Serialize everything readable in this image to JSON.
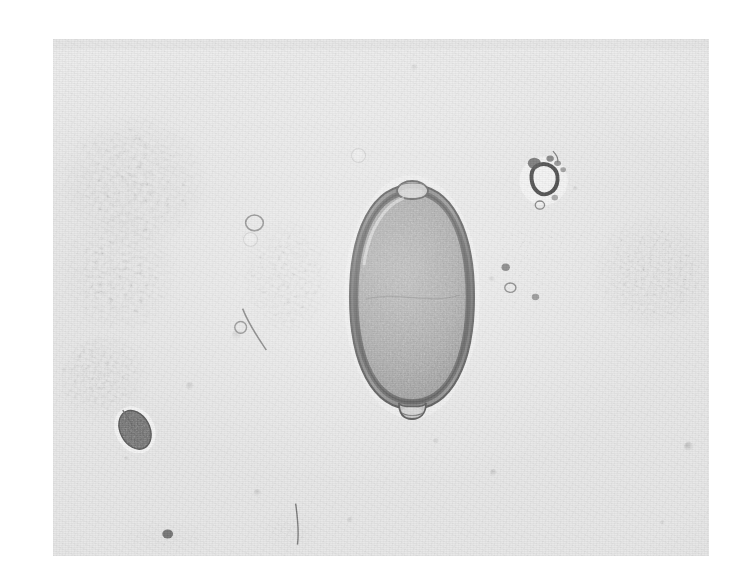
{
  "image": {
    "kind": "light-micrograph",
    "medium": "black-and-white photographic print",
    "subject": "Trichuris trichiura (whipworm) egg in faecal smear",
    "background_color": "#ffffff",
    "plate_color": "#e7e7e7",
    "plate": {
      "left": 53,
      "top": 39,
      "width": 656,
      "height": 517
    },
    "canvas": {
      "width": 741,
      "height": 587
    }
  },
  "specimen": {
    "name": "whipworm-egg",
    "common_name": "Trichuris trichiura egg",
    "shape": "barrel / lemon shaped",
    "features": [
      "bipolar mucoid plugs",
      "thick smooth shell",
      "granular unembryonated contents"
    ],
    "position": {
      "left": 342,
      "top": 173,
      "width": 140,
      "height": 248
    },
    "shell_color": "#6d6d6d",
    "interior_color": "#9b9b9b",
    "plug_color": "#c9c9c9"
  },
  "field_objects": [
    {
      "name": "debris-cluster-upper-left",
      "left": 60,
      "top": 112,
      "width": 150,
      "height": 140,
      "density": 0.95,
      "seed": 11
    },
    {
      "name": "debris-cluster-mid-left",
      "left": 64,
      "top": 206,
      "width": 120,
      "height": 132,
      "density": 0.85,
      "seed": 23
    },
    {
      "name": "debris-cluster-center",
      "left": 232,
      "top": 214,
      "width": 110,
      "height": 138,
      "density": 0.9,
      "seed": 37
    },
    {
      "name": "debris-cluster-lower-left",
      "left": 62,
      "top": 336,
      "width": 110,
      "height": 110,
      "density": 0.7,
      "seed": 53
    },
    {
      "name": "debris-cluster-right-upper",
      "left": 512,
      "top": 148,
      "width": 80,
      "height": 90,
      "density": 0.6,
      "seed": 71
    },
    {
      "name": "debris-cluster-right-mid",
      "left": 500,
      "top": 230,
      "width": 110,
      "height": 80,
      "density": 0.55,
      "seed": 89
    },
    {
      "name": "debris-cluster-right-large",
      "left": 586,
      "top": 200,
      "width": 128,
      "height": 130,
      "density": 1.0,
      "seed": 101
    },
    {
      "name": "debris-cluster-bottom-left",
      "left": 110,
      "top": 516,
      "width": 110,
      "height": 36,
      "density": 0.45,
      "seed": 113
    },
    {
      "name": "debris-cluster-bottom-mid",
      "left": 256,
      "top": 500,
      "width": 70,
      "height": 52,
      "density": 0.45,
      "seed": 127
    },
    {
      "name": "dark-ovoid-body",
      "left": 108,
      "top": 400,
      "width": 54,
      "height": 58,
      "density": 1.0,
      "seed": 139
    }
  ],
  "specks": [
    {
      "name": "speck-a",
      "left": 351,
      "top": 148,
      "size": 13,
      "opacity": 0.55
    },
    {
      "name": "speck-b",
      "left": 243,
      "top": 232,
      "size": 13,
      "opacity": 0.5
    },
    {
      "name": "speck-c",
      "left": 186,
      "top": 382,
      "size": 8,
      "opacity": 0.4
    },
    {
      "name": "speck-d",
      "left": 489,
      "top": 276,
      "size": 6,
      "opacity": 0.4
    },
    {
      "name": "speck-e",
      "left": 433,
      "top": 438,
      "size": 6,
      "opacity": 0.35
    },
    {
      "name": "speck-f",
      "left": 347,
      "top": 517,
      "size": 6,
      "opacity": 0.35
    },
    {
      "name": "speck-g",
      "left": 254,
      "top": 489,
      "size": 7,
      "opacity": 0.4
    },
    {
      "name": "speck-h",
      "left": 490,
      "top": 469,
      "size": 7,
      "opacity": 0.45
    },
    {
      "name": "speck-i",
      "left": 684,
      "top": 442,
      "size": 9,
      "opacity": 0.6
    },
    {
      "name": "speck-j",
      "left": 573,
      "top": 186,
      "size": 5,
      "opacity": 0.35
    },
    {
      "name": "speck-k",
      "left": 411,
      "top": 64,
      "size": 7,
      "opacity": 0.35
    },
    {
      "name": "speck-l",
      "left": 660,
      "top": 520,
      "size": 5,
      "opacity": 0.3
    },
    {
      "name": "speck-m",
      "left": 124,
      "top": 456,
      "size": 5,
      "opacity": 0.3
    },
    {
      "name": "speck-n",
      "left": 232,
      "top": 330,
      "size": 10,
      "opacity": 0.32
    }
  ]
}
